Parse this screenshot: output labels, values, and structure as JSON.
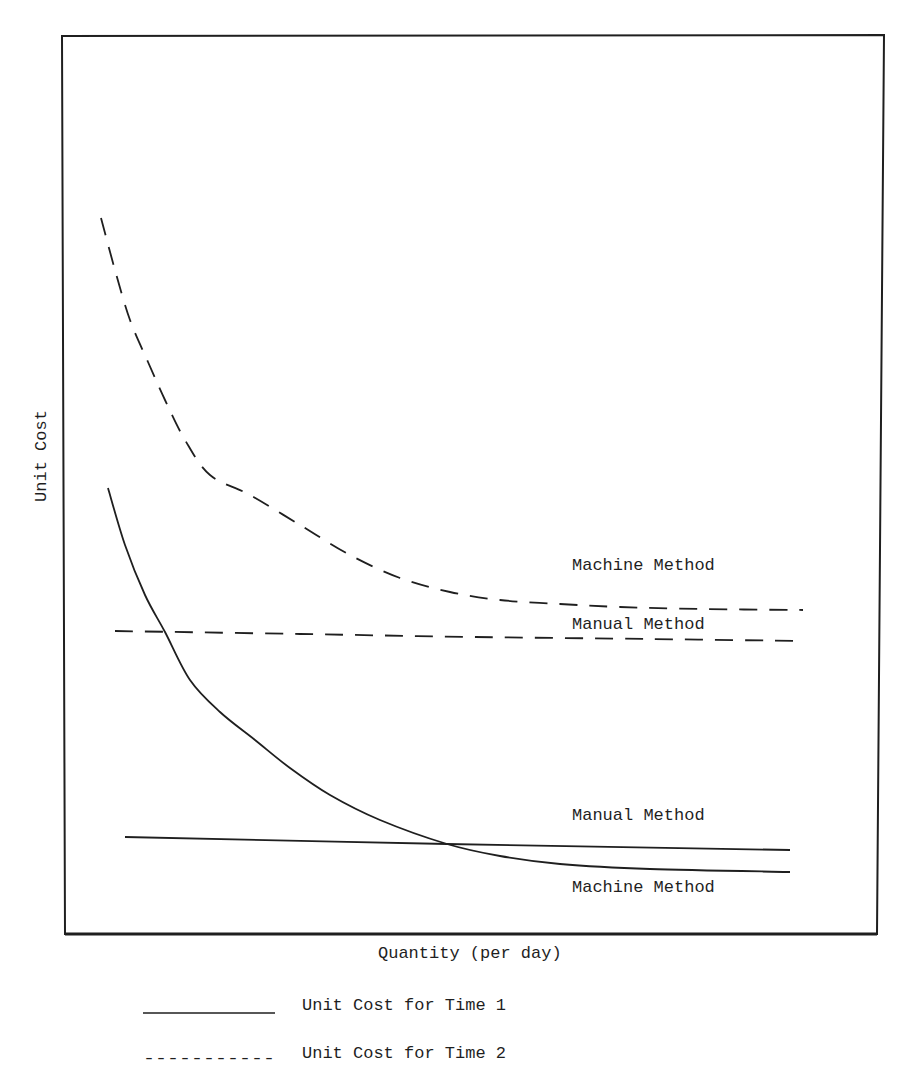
{
  "chart_data": {
    "type": "line",
    "title": "",
    "xlabel": "Quantity (per day)",
    "ylabel": "Unit Cost",
    "grid": false,
    "ticks": "none",
    "legend_position": "bottom-left, below chart",
    "legend": [
      {
        "label": "Unit Cost for Time 1",
        "style": "solid"
      },
      {
        "label": "Unit Cost for Time 2",
        "style": "dashed"
      }
    ],
    "series": [
      {
        "name": "Machine Method (Time 2)",
        "style": "dashed",
        "annotation": "Machine Method",
        "points_px": [
          [
            101,
            218
          ],
          [
            115,
            270
          ],
          [
            130,
            320
          ],
          [
            148,
            362
          ],
          [
            165,
            400
          ],
          [
            185,
            440
          ],
          [
            210,
            475
          ],
          [
            250,
            495
          ],
          [
            300,
            525
          ],
          [
            350,
            555
          ],
          [
            400,
            578
          ],
          [
            450,
            592
          ],
          [
            500,
            600
          ],
          [
            560,
            604
          ],
          [
            620,
            607
          ],
          [
            700,
            609
          ],
          [
            803,
            610
          ]
        ]
      },
      {
        "name": "Manual Method (Time 2)",
        "style": "dashed",
        "annotation": "Manual Method",
        "points_px": [
          [
            115,
            631
          ],
          [
            300,
            634
          ],
          [
            475,
            637
          ],
          [
            650,
            639
          ],
          [
            803,
            641
          ]
        ]
      },
      {
        "name": "Machine Method (Time 1)",
        "style": "solid",
        "annotation": "Machine Method",
        "points_px": [
          [
            108,
            488
          ],
          [
            125,
            545
          ],
          [
            145,
            595
          ],
          [
            165,
            632
          ],
          [
            190,
            680
          ],
          [
            220,
            712
          ],
          [
            255,
            740
          ],
          [
            290,
            768
          ],
          [
            330,
            795
          ],
          [
            380,
            820
          ],
          [
            447,
            844
          ],
          [
            500,
            856
          ],
          [
            560,
            864
          ],
          [
            650,
            869
          ],
          [
            790,
            872
          ]
        ]
      },
      {
        "name": "Manual Method (Time 1)",
        "style": "solid",
        "annotation": "Manual Method",
        "points_px": [
          [
            125,
            837
          ],
          [
            447,
            844
          ],
          [
            790,
            850
          ]
        ]
      }
    ],
    "annotations": [
      {
        "text": "Machine Method",
        "near": "upper dashed curve right end"
      },
      {
        "text": "Manual Method",
        "near": "lower dashed line right end"
      },
      {
        "text": "Manual Method",
        "near": "solid horizontal line right end"
      },
      {
        "text": "Machine Method",
        "near": "solid curve right end"
      }
    ]
  },
  "labels": {
    "ylabel": "Unit Cost",
    "xlabel": "Quantity (per day)",
    "machine_t2": "Machine Method",
    "manual_t2": "Manual Method",
    "manual_t1": "Manual Method",
    "machine_t1": "Machine Method",
    "legend_t1": "Unit Cost for Time 1",
    "legend_t2": "Unit Cost for Time 2",
    "legend_t2_swatch": "-----------"
  },
  "colors": {
    "ink": "#1f1f1f",
    "background": "#ffffff"
  }
}
